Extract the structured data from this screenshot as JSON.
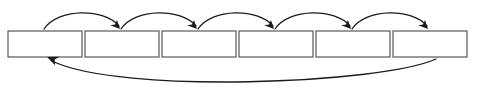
{
  "diagram": {
    "background_color": "#ffffff",
    "box_stroke_color": "#58585a",
    "box_fill_color": "#ffffff",
    "arrow_color": "#1b1b1b",
    "boxes": [
      {
        "id": "box-1",
        "label": "",
        "x": 8,
        "y": 31,
        "width": 74,
        "height": 26
      },
      {
        "id": "box-2",
        "label": "",
        "x": 85,
        "y": 31,
        "width": 74,
        "height": 26
      },
      {
        "id": "box-3",
        "label": "",
        "x": 162,
        "y": 31,
        "width": 74,
        "height": 26
      },
      {
        "id": "box-4",
        "label": "",
        "x": 239,
        "y": 31,
        "width": 74,
        "height": 26
      },
      {
        "id": "box-5",
        "label": "",
        "x": 316,
        "y": 31,
        "width": 74,
        "height": 26
      },
      {
        "id": "box-6",
        "label": "",
        "x": 393,
        "y": 31,
        "width": 74,
        "height": 26
      }
    ],
    "forward_arrows": [
      {
        "id": "arrow-1-2",
        "from": "box-1",
        "to": "box-2",
        "path": "M 44 29 C 58 8, 104 8, 119 26",
        "head_x": 120,
        "head_y": 29,
        "head_angle": 52
      },
      {
        "id": "arrow-2-3",
        "from": "box-2",
        "to": "box-3",
        "path": "M 121 29 C 135 8, 181 8, 196 26",
        "head_x": 197,
        "head_y": 29,
        "head_angle": 52
      },
      {
        "id": "arrow-3-4",
        "from": "box-3",
        "to": "box-4",
        "path": "M 198 29 C 212 8, 258 8, 273 26",
        "head_x": 274,
        "head_y": 29,
        "head_angle": 52
      },
      {
        "id": "arrow-4-5",
        "from": "box-4",
        "to": "box-5",
        "path": "M 275 29 C 289 8, 335 8, 350 26",
        "head_x": 351,
        "head_y": 29,
        "head_angle": 52
      },
      {
        "id": "arrow-5-6",
        "from": "box-5",
        "to": "box-6",
        "path": "M 352 29 C 366 8, 412 8, 427 26",
        "head_x": 428,
        "head_y": 29,
        "head_angle": 52
      }
    ],
    "feedback_arrow": {
      "id": "arrow-6-1",
      "from": "box-6",
      "to": "box-1",
      "path": "M 436 59 C 380 84, 120 94, 52 61",
      "head_x": 47,
      "head_y": 57,
      "head_angle": 208
    }
  }
}
